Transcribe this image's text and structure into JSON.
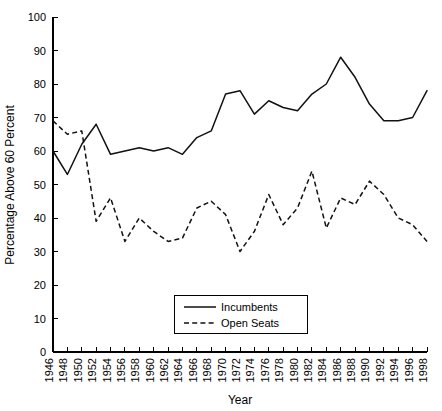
{
  "chart_data": {
    "type": "line",
    "title": "",
    "xlabel": "Year",
    "ylabel": "Percentage Above 60 Percent",
    "xlim": [
      1946,
      1998
    ],
    "ylim": [
      0,
      100
    ],
    "grid": false,
    "legend_position": "bottom-center",
    "x": [
      1946,
      1948,
      1950,
      1952,
      1954,
      1956,
      1958,
      1960,
      1962,
      1964,
      1966,
      1968,
      1970,
      1972,
      1974,
      1976,
      1978,
      1980,
      1982,
      1984,
      1986,
      1988,
      1990,
      1992,
      1994,
      1996,
      1998
    ],
    "xtick_labels": [
      "1946",
      "1948",
      "1950",
      "1952",
      "1954",
      "1956",
      "1958",
      "1960",
      "1962",
      "1964",
      "1966",
      "1968",
      "1970",
      "1972",
      "1974",
      "1976",
      "1978",
      "1980",
      "1982",
      "1984",
      "1986",
      "1988",
      "1990",
      "1992",
      "1994",
      "1996",
      "1998"
    ],
    "ytick_labels": [
      "0",
      "10",
      "20",
      "30",
      "40",
      "50",
      "60",
      "70",
      "80",
      "90",
      "100"
    ],
    "yticks": [
      0,
      10,
      20,
      30,
      40,
      50,
      60,
      70,
      80,
      90,
      100
    ],
    "series": [
      {
        "name": "Incumbents",
        "style": "solid",
        "values": [
          60,
          53,
          62,
          68,
          59,
          60,
          61,
          60,
          61,
          59,
          64,
          66,
          77,
          78,
          71,
          75,
          73,
          72,
          77,
          80,
          88,
          82,
          74,
          69,
          69,
          70,
          78
        ]
      },
      {
        "name": "Open Seats",
        "style": "dashed",
        "values": [
          69,
          65,
          66,
          39,
          46,
          33,
          40,
          36,
          33,
          34,
          43,
          45,
          41,
          30,
          36,
          47,
          38,
          43,
          54,
          37,
          46,
          44,
          51,
          47,
          40,
          38,
          33
        ]
      }
    ]
  },
  "legend": {
    "items": [
      {
        "label": "Incumbents",
        "style": "solid"
      },
      {
        "label": "Open Seats",
        "style": "dashed"
      }
    ]
  }
}
